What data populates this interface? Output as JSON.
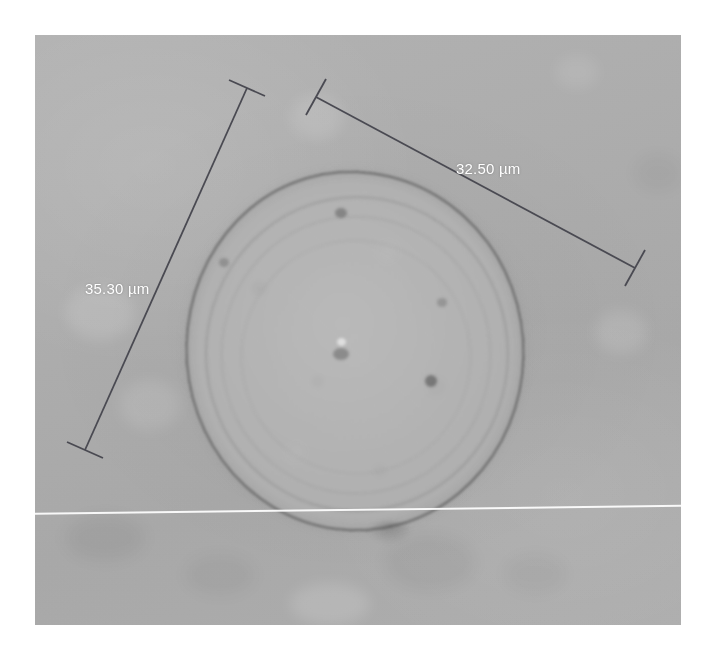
{
  "image": {
    "kind": "light-microscopy-micrograph",
    "subject": "spherical cell / spore with dark outer rim and concentric internal rings",
    "background_color": "#ababab",
    "rim_color": "#5a5a5a",
    "scanline_color": "#ffffff"
  },
  "measurements": {
    "unit": "µm",
    "annotation_color": "#4a4a52",
    "label_color": "#ffffff",
    "items": [
      {
        "id": "measurement-upper-right",
        "label": "32.50 µm",
        "value": 32.5,
        "unit": "µm",
        "start": {
          "x": 316,
          "y": 97
        },
        "end": {
          "x": 635,
          "y": 268
        },
        "label_position": {
          "x": 456,
          "y": 160
        }
      },
      {
        "id": "measurement-left",
        "label": "35.30 µm",
        "value": 35.3,
        "unit": "µm",
        "start": {
          "x": 247,
          "y": 88
        },
        "end": {
          "x": 85,
          "y": 450
        },
        "label_position": {
          "x": 85,
          "y": 280
        }
      }
    ]
  },
  "features": {
    "cell": {
      "center": {
        "x": 352,
        "y": 370
      },
      "width": 340,
      "height": 362
    },
    "scanline": {
      "y_left": 513,
      "y_right": 505
    }
  }
}
